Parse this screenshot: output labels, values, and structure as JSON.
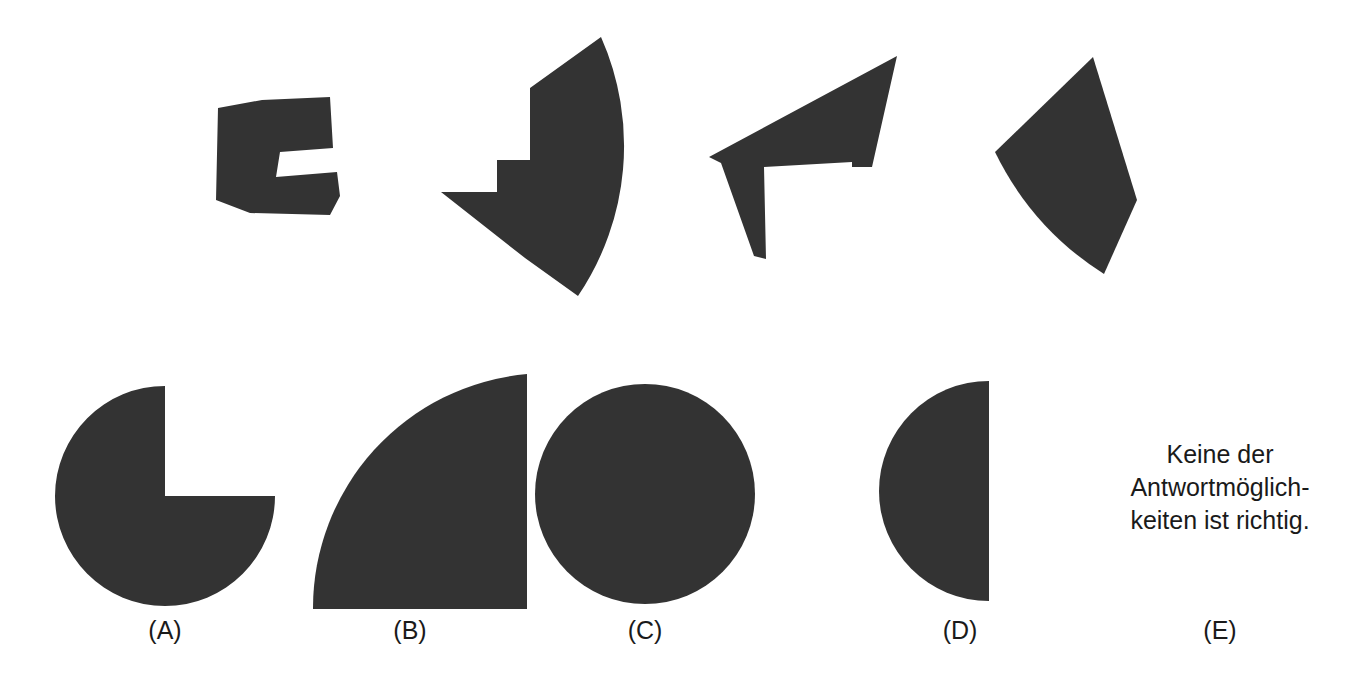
{
  "page": {
    "width": 1361,
    "height": 693,
    "background_color": "#ffffff",
    "shape_fill_color": "#333333",
    "text_color": "#1a1a1a",
    "kind": "paper-folding / shape-assembly multiple-choice figure"
  },
  "prompt_shapes": [
    {
      "name": "prompt-shape-1",
      "description": "dark quadrilateral with a notch cut into the upper right, like a stepped polygon",
      "points": "218,108 262,100 330,97 333,148 280,152 276,177 337,172 340,196 330,215 250,213 216,200"
    },
    {
      "name": "prompt-shape-2",
      "description": "dark quarter-annulus wedge with an L-shaped notch removed from the lower left",
      "points": "530,88 601,37 610,60 619,120 619,175 605,232 582,294 560,262 527,224 497,192 441,192 446,203 525,258 504,232 495,185 495,160 530,160"
    },
    {
      "name": "prompt-shape-3",
      "description": "dark arrow-like polygon with a notch on the lower edge and a downward spike",
      "points": "879,50 898,57 871,167 852,168 852,163 763,168 767,258 756,258 722,163 710,157 712,152"
    },
    {
      "name": "prompt-shape-4",
      "description": "dark curved kite / quarter-segment wedge tilted to the right",
      "points": "1093,57 1137,200 1104,274 1051,232 1013,185 995,152"
    }
  ],
  "answers": [
    {
      "id": "A",
      "label": "(A)",
      "label_x": 165,
      "label_y": 630,
      "shape": "three-quarter-circle-pacman",
      "description": "three-quarter disc (circle with quarter removed from the upper right)",
      "cx": 165,
      "cy": 496,
      "r": 110
    },
    {
      "id": "B",
      "label": "(B)",
      "label_x": 410,
      "label_y": 630,
      "shape": "quarter-circle",
      "description": "quarter disc with the right angle corner at the bottom right",
      "cx": 527,
      "cy": 374,
      "r": 235
    },
    {
      "id": "C",
      "label": "(C)",
      "label_x": 645,
      "label_y": 630,
      "shape": "full-circle",
      "description": "full filled circle",
      "cx": 645,
      "cy": 494,
      "r": 110
    },
    {
      "id": "D",
      "label": "(D)",
      "label_x": 960,
      "label_y": 630,
      "shape": "half-circle",
      "description": "left half disc with the flat diameter edge on the right side",
      "cx": 989,
      "cy": 491,
      "r": 110
    },
    {
      "id": "E",
      "label": "(E)",
      "label_x": 1220,
      "label_y": 630,
      "shape": "text-option",
      "description": "text answer option, no figure",
      "text": "Keine der\nAntwortmöglich-\nkeiten ist richtig."
    }
  ],
  "none_of_the_above": {
    "line1": "Keine der",
    "line2": "Antwortmöglich-",
    "line3": "keiten ist richtig.",
    "full_text": "Keine der\nAntwortmöglich-\nkeiten ist richtig."
  }
}
